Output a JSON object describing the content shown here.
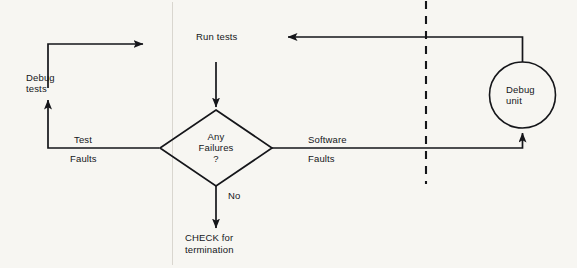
{
  "diagram": {
    "type": "flowchart",
    "background_color": "#f7f6f2",
    "stroke_color": "#15161a",
    "nodes": [
      {
        "id": "run-tests",
        "shape": "text",
        "label": "Run tests"
      },
      {
        "id": "any-failures",
        "shape": "diamond",
        "label_line1": "Any",
        "label_line2": "Failures",
        "label_line3": "?"
      },
      {
        "id": "debug-tests",
        "shape": "text",
        "label_line1": "Debug",
        "label_line2": "tests"
      },
      {
        "id": "debug-unit",
        "shape": "circle",
        "label_line1": "Debug",
        "label_line2": "unit"
      },
      {
        "id": "check-termination",
        "shape": "text",
        "label_line1": "CHECK for",
        "label_line2": "termination"
      }
    ],
    "edge_labels": [
      {
        "id": "test-faults-above",
        "text": "Test"
      },
      {
        "id": "test-faults-below",
        "text": "Faults"
      },
      {
        "id": "software-faults-above",
        "text": "Software"
      },
      {
        "id": "software-faults-below",
        "text": "Faults"
      },
      {
        "id": "no-branch",
        "text": "No"
      }
    ],
    "separator": {
      "id": "dashed-boundary",
      "style": "dashed-vertical"
    }
  }
}
